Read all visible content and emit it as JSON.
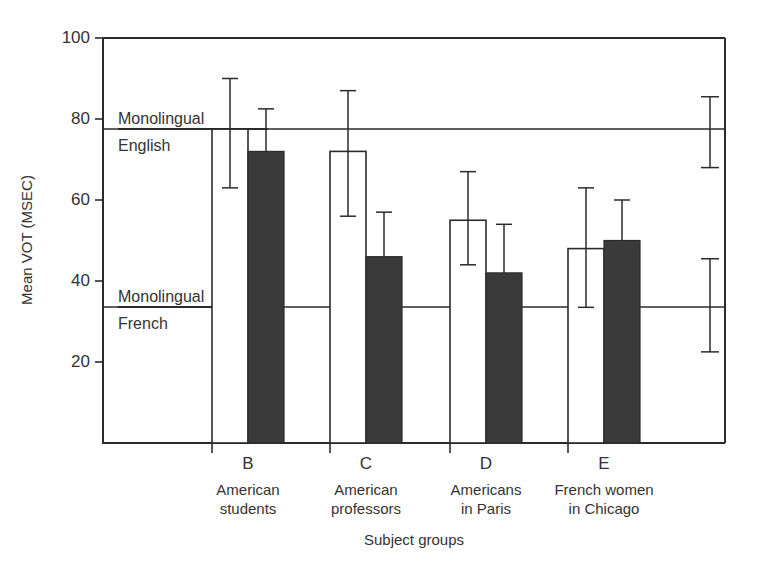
{
  "chart_data": {
    "type": "bar",
    "title": "",
    "xlabel": "Subject groups",
    "ylabel": "Mean VOT (MSEC)",
    "ylim": [
      0,
      100
    ],
    "ytick_labels": [
      "100",
      "80",
      "60",
      "40",
      "20"
    ],
    "ytick_values": [
      100,
      80,
      60,
      40,
      20
    ],
    "grid": false,
    "legend_position": "none",
    "categories": [
      "B",
      "C",
      "D",
      "E"
    ],
    "category_names": [
      [
        "American",
        "students"
      ],
      [
        "American",
        "professors"
      ],
      [
        "Americans",
        "in Paris"
      ],
      [
        "French women",
        "in Chicago"
      ]
    ],
    "series": [
      {
        "name": "open",
        "style": "open",
        "values": [
          77.5,
          72,
          55,
          48
        ],
        "err_upper": [
          90,
          87,
          67,
          63
        ],
        "err_lower": [
          63,
          56,
          44,
          33.5
        ]
      },
      {
        "name": "filled",
        "style": "filled",
        "values": [
          72,
          46,
          42,
          50
        ],
        "err_upper": [
          82.5,
          57,
          54,
          60
        ],
        "err_lower": [
          72,
          46,
          42,
          50
        ]
      }
    ],
    "reference_lines": [
      {
        "id": "monolingual-english",
        "label_line1": "Monolingual",
        "label_line2": "English",
        "value": 77.5,
        "err_upper": 85.5,
        "err_lower": 68
      },
      {
        "id": "monolingual-french",
        "label_line1": "Monolingual",
        "label_line2": "French",
        "value": 33.5,
        "err_upper": 45.5,
        "err_lower": 22.5
      }
    ]
  }
}
